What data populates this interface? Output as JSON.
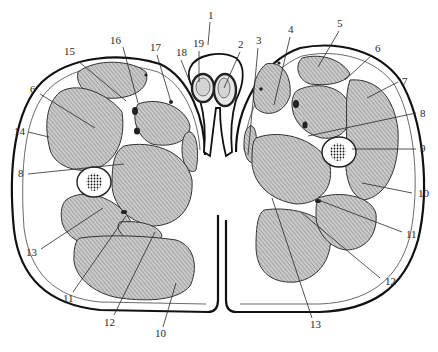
{
  "figure": {
    "colors": {
      "ink": "#2a2a2a",
      "hatch_bg": "#c8c8c8",
      "hatch_line": "#777777",
      "paper": "#ffffff"
    }
  },
  "labels": [
    {
      "id": "1",
      "text": "1",
      "x": 208,
      "y": 19,
      "lx1": 210,
      "ly1": 22,
      "lx2": 208,
      "ly2": 45
    },
    {
      "id": "2",
      "text": "2",
      "x": 238,
      "y": 48,
      "lx1": 240,
      "ly1": 52,
      "lx2": 224,
      "ly2": 88
    },
    {
      "id": "3",
      "text": "3",
      "x": 256,
      "y": 44,
      "lx1": 258,
      "ly1": 48,
      "lx2": 248,
      "ly2": 155
    },
    {
      "id": "4",
      "text": "4",
      "x": 288,
      "y": 33,
      "lx1": 290,
      "ly1": 37,
      "lx2": 274,
      "ly2": 105
    },
    {
      "id": "5",
      "text": "5",
      "x": 337,
      "y": 27,
      "lx1": 339,
      "ly1": 31,
      "lx2": 318,
      "ly2": 67
    },
    {
      "id": "6",
      "text": "6",
      "x": 375,
      "y": 52,
      "lx1": 372,
      "ly1": 55,
      "lx2": 345,
      "ly2": 80
    },
    {
      "id": "7",
      "text": "7",
      "x": 402,
      "y": 85,
      "lx1": 398,
      "ly1": 82,
      "lx2": 367,
      "ly2": 98
    },
    {
      "id": "8",
      "text": "8",
      "x": 420,
      "y": 117,
      "lx1": 416,
      "ly1": 113,
      "lx2": 308,
      "ly2": 136
    },
    {
      "id": "9",
      "text": "9",
      "x": 420,
      "y": 152,
      "lx1": 416,
      "ly1": 149,
      "lx2": 352,
      "ly2": 149
    },
    {
      "id": "10",
      "text": "10",
      "x": 418,
      "y": 197,
      "lx1": 412,
      "ly1": 193,
      "lx2": 362,
      "ly2": 183
    },
    {
      "id": "11",
      "text": "11",
      "x": 406,
      "y": 238,
      "lx1": 402,
      "ly1": 232,
      "lx2": 321,
      "ly2": 201
    },
    {
      "id": "12",
      "text": "12",
      "x": 385,
      "y": 285,
      "lx1": 380,
      "ly1": 278,
      "lx2": 302,
      "ly2": 213
    },
    {
      "id": "13",
      "text": "13",
      "x": 310,
      "y": 328,
      "lx1": 312,
      "ly1": 318,
      "lx2": 272,
      "ly2": 198
    },
    {
      "id": "14",
      "text": "14",
      "x": 14,
      "y": 135,
      "lx1": 28,
      "ly1": 132,
      "lx2": 49,
      "ly2": 137
    },
    {
      "id": "15",
      "text": "15",
      "x": 64,
      "y": 55,
      "lx1": 78,
      "ly1": 61,
      "lx2": 126,
      "ly2": 101
    },
    {
      "id": "16",
      "text": "16",
      "x": 110,
      "y": 44,
      "lx1": 123,
      "ly1": 47,
      "lx2": 138,
      "ly2": 103
    },
    {
      "id": "17",
      "text": "17",
      "x": 150,
      "y": 51,
      "lx1": 157,
      "ly1": 55,
      "lx2": 171,
      "ly2": 102
    },
    {
      "id": "18",
      "text": "18",
      "x": 176,
      "y": 56,
      "lx1": 181,
      "ly1": 60,
      "lx2": 189,
      "ly2": 80
    },
    {
      "id": "19",
      "text": "19",
      "x": 193,
      "y": 47,
      "lx1": 199,
      "ly1": 51,
      "lx2": 199,
      "ly2": 82
    },
    {
      "id": "6b",
      "text": "6",
      "x": 30,
      "y": 93,
      "lx1": 40,
      "ly1": 94,
      "lx2": 95,
      "ly2": 128
    },
    {
      "id": "8b",
      "text": "8",
      "x": 18,
      "y": 177,
      "lx1": 28,
      "ly1": 174,
      "lx2": 124,
      "ly2": 164
    },
    {
      "id": "13b",
      "text": "13",
      "x": 26,
      "y": 256,
      "lx1": 41,
      "ly1": 249,
      "lx2": 103,
      "ly2": 208
    },
    {
      "id": "11b",
      "text": "11",
      "x": 63,
      "y": 302,
      "lx1": 73,
      "ly1": 292,
      "lx2": 126,
      "ly2": 216
    },
    {
      "id": "12b",
      "text": "12",
      "x": 104,
      "y": 326,
      "lx1": 114,
      "ly1": 315,
      "lx2": 155,
      "ly2": 232
    },
    {
      "id": "10b",
      "text": "10",
      "x": 155,
      "y": 337,
      "lx1": 163,
      "ly1": 327,
      "lx2": 176,
      "ly2": 283
    }
  ]
}
